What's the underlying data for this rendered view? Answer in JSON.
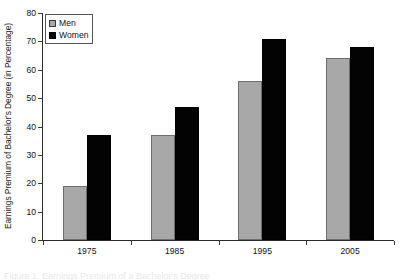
{
  "chart_data": {
    "type": "bar",
    "title": "",
    "xlabel": "",
    "ylabel": "Earnings Premium of Bachelor's Degree (in Percentage)",
    "categories": [
      "1975",
      "1985",
      "1995",
      "2005"
    ],
    "series": [
      {
        "name": "Men",
        "color": "#a8a8a8",
        "values": [
          19,
          37,
          56,
          64
        ]
      },
      {
        "name": "Women",
        "color": "#000000",
        "values": [
          37,
          47,
          71,
          68
        ]
      }
    ],
    "ylim": [
      0,
      80
    ],
    "yticks": [
      0,
      10,
      20,
      30,
      40,
      50,
      60,
      70,
      80
    ],
    "ytick_labels": [
      "0",
      "10",
      "20",
      "30",
      "40",
      "50",
      "60",
      "70",
      "80"
    ],
    "grid": false,
    "legend_position": "upper-left",
    "legend_entries": [
      "Men",
      "Women"
    ],
    "axis_color": "#2b2b2b"
  },
  "caption": {
    "cropped_text": "Figure 1. Earnings Premium of a Bachelor's Degree"
  }
}
